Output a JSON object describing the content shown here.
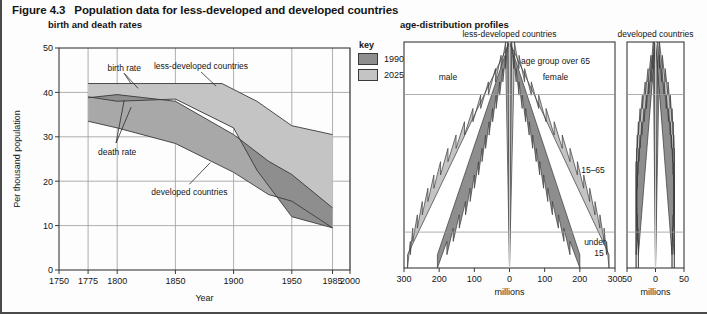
{
  "figure": {
    "number": "Figure 4.3",
    "title": "Population data for less-developed and developed countries",
    "left_subtitle": "birth and death rates",
    "right_subtitle": "age-distribution profiles"
  },
  "key": {
    "title": "key",
    "items": [
      {
        "label": "1990",
        "color": "#8e8e8e"
      },
      {
        "label": "2025",
        "color": "#c4c4c4"
      }
    ]
  },
  "colors": {
    "dark_gray": "#8e8e8e",
    "light_gray": "#c4c4c4",
    "mid_gray": "#a8a8a8",
    "outline": "#3a3a3a",
    "grid": "#9a9a9a",
    "axis": "#3a3a3a"
  },
  "chart_data": [
    {
      "type": "area",
      "id": "birth-death-rates",
      "title": "birth and death rates",
      "xlabel": "Year",
      "ylabel": "Per thousand population",
      "xlim": [
        1750,
        2000
      ],
      "ylim": [
        0,
        50
      ],
      "xticks": [
        1750,
        1775,
        1800,
        1850,
        1900,
        1950,
        1985,
        2000
      ],
      "yticks": [
        0,
        10,
        20,
        30,
        40,
        50
      ],
      "grid": true,
      "annotations": [
        {
          "text": "birth rate",
          "x": 1806,
          "y": 45.5
        },
        {
          "text": "death rate",
          "x": 1800,
          "y": 26.5
        },
        {
          "text": "less-developed countries",
          "x": 1872,
          "y": 46.0
        },
        {
          "text": "developed countries",
          "x": 1862,
          "y": 17.5
        }
      ],
      "series": [
        {
          "name": "less-developed birth rate",
          "x": [
            1775,
            1890,
            1920,
            1950,
            1985
          ],
          "values": [
            42.0,
            42.0,
            38.0,
            32.5,
            30.5
          ]
        },
        {
          "name": "less-developed death rate",
          "x": [
            1775,
            1800,
            1850,
            1900,
            1920,
            1950,
            1985
          ],
          "values": [
            39.0,
            38.0,
            38.5,
            32.0,
            22.5,
            12.0,
            9.5
          ]
        },
        {
          "name": "developed birth rate",
          "x": [
            1775,
            1800,
            1850,
            1900,
            1930,
            1950,
            1985
          ],
          "values": [
            38.8,
            39.5,
            38.0,
            30.5,
            24.5,
            21.5,
            14.0
          ]
        },
        {
          "name": "developed death rate",
          "x": [
            1775,
            1800,
            1850,
            1900,
            1930,
            1950,
            1985
          ],
          "values": [
            33.5,
            32.0,
            28.5,
            22.0,
            17.0,
            15.5,
            9.5
          ]
        }
      ]
    },
    {
      "type": "bar",
      "id": "pyramid-less-developed",
      "title": "less-developed countries",
      "xlabel": "millions",
      "xlim": [
        -300,
        300
      ],
      "xticks": [
        -300,
        -200,
        -100,
        0,
        100,
        200,
        300
      ],
      "xticklabels": [
        "300",
        "200",
        "100",
        "0",
        "100",
        "200",
        "300"
      ],
      "side_labels": [
        "male",
        "female"
      ],
      "age_band_labels": [
        "age group over 65",
        "15–65",
        "under 15"
      ],
      "series": [
        {
          "name": "1990",
          "color": "#8e8e8e",
          "male": [
            205,
            178,
            160,
            143,
            125,
            112,
            100,
            88,
            78,
            68,
            58,
            48,
            38,
            28,
            19,
            11,
            5
          ],
          "female": [
            200,
            172,
            155,
            139,
            122,
            109,
            97,
            86,
            76,
            66,
            56,
            46,
            36,
            27,
            19,
            12,
            6
          ]
        },
        {
          "name": "2025",
          "color": "#c4c4c4",
          "male": [
            290,
            282,
            275,
            262,
            248,
            232,
            215,
            196,
            175,
            152,
            128,
            104,
            82,
            60,
            40,
            24,
            11
          ],
          "female": [
            283,
            276,
            269,
            257,
            243,
            228,
            211,
            193,
            172,
            150,
            127,
            104,
            83,
            62,
            43,
            27,
            14
          ]
        }
      ]
    },
    {
      "type": "bar",
      "id": "pyramid-developed",
      "title": "developed countries",
      "xlabel": "millions",
      "xlim": [
        -50,
        50
      ],
      "xticks": [
        -50,
        0,
        50
      ],
      "xticklabels": [
        "50",
        "0",
        "50"
      ],
      "series": [
        {
          "name": "1990",
          "color": "#8e8e8e",
          "male": [
            30,
            30,
            31,
            32,
            33,
            33,
            32,
            31,
            29,
            27,
            24,
            20,
            16,
            12,
            8,
            5,
            2
          ],
          "female": [
            29,
            29,
            30,
            31,
            32,
            32,
            32,
            31,
            30,
            28,
            26,
            23,
            19,
            15,
            11,
            7,
            4
          ]
        },
        {
          "name": "2025",
          "color": "#c4c4c4",
          "male": [
            34,
            34,
            34,
            34,
            34,
            34,
            34,
            34,
            33,
            32,
            30,
            27,
            23,
            18,
            13,
            8,
            4
          ],
          "female": [
            33,
            33,
            33,
            33,
            33,
            33,
            33,
            33,
            33,
            32,
            31,
            29,
            26,
            22,
            17,
            12,
            7
          ]
        }
      ]
    }
  ]
}
